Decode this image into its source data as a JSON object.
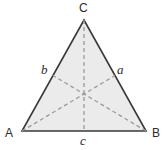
{
  "figure": {
    "type": "geometry-diagram",
    "canvas": {
      "width": 167,
      "height": 150
    },
    "colors": {
      "background": "#ffffff",
      "triangle_fill": "#ebebeb",
      "triangle_stroke": "#3a3a3a",
      "median_stroke": "#9a9a9a",
      "label_color": "#2b2b2b"
    },
    "triangle": {
      "stroke_width": 1.6,
      "vertices": [
        {
          "name": "A",
          "label": "A",
          "x": 22,
          "y": 131
        },
        {
          "name": "B",
          "label": "B",
          "x": 146,
          "y": 131
        },
        {
          "name": "C",
          "label": "C",
          "x": 84,
          "y": 20
        }
      ]
    },
    "midpoints": [
      {
        "name": "a",
        "label": "a",
        "on_side": "CB",
        "x": 115,
        "y": 75.5
      },
      {
        "name": "b",
        "label": "b",
        "on_side": "AC",
        "x": 53,
        "y": 75.5
      },
      {
        "name": "c",
        "label": "c",
        "on_side": "AB",
        "x": 84,
        "y": 131
      }
    ],
    "centroid": {
      "x": 84,
      "y": 94
    },
    "medians": [
      {
        "name": "median-C-to-c",
        "from": "C",
        "to": "c",
        "x1": 84,
        "y1": 20,
        "x2": 84,
        "y2": 131
      },
      {
        "name": "median-A-to-a",
        "from": "A",
        "to": "a",
        "x1": 22,
        "y1": 131,
        "x2": 115,
        "y2": 75.5
      },
      {
        "name": "median-B-to-b",
        "from": "B",
        "to": "b",
        "x1": 146,
        "y1": 131,
        "x2": 53,
        "y2": 75.5
      }
    ],
    "median_dash": "4 3",
    "median_stroke_width": 1.3
  }
}
